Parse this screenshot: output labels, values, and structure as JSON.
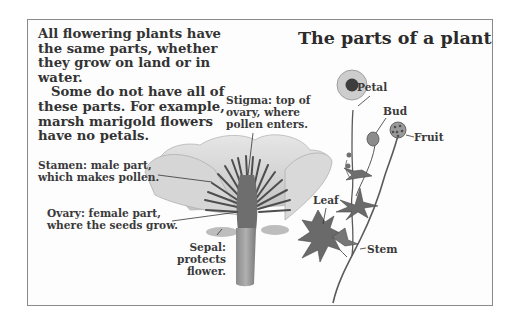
{
  "title": "The parts of a plant",
  "intro": {
    "paragraph1": "All flowering plants have the same parts, whether they grow on land or in water.",
    "paragraph2": "Some do not have all of these parts. For example, marsh marigold flowers have no petals."
  },
  "labels": {
    "stigma": [
      "Stigma: top of",
      "ovary, where",
      "pollen enters."
    ],
    "stamen": [
      "Stamen: male part,",
      "which makes pollen."
    ],
    "ovary": [
      "Ovary: female part,",
      "where the seeds grow."
    ],
    "sepal": [
      "Sepal:",
      "protects",
      "flower."
    ],
    "petal": "Petal",
    "bud": "Bud",
    "fruit": "Fruit",
    "leaf": "Leaf",
    "stem": "Stem"
  },
  "colors": {
    "border": "#8a8a8a",
    "text": "#2b2b2b",
    "petal_fill": "#d4d4d4",
    "stamen": "#555555",
    "plant": "#5a5a5a"
  }
}
